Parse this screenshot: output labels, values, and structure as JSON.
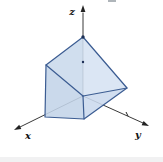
{
  "colors": {
    "background": "#ffffff",
    "axis": "#222222",
    "solid_stroke": "#3b5c92",
    "label": "#141414",
    "dot": "#1c2f55"
  },
  "axes": {
    "origin": [
      83,
      96
    ],
    "items": [
      {
        "name": "z",
        "label": "z",
        "line_end": [
          83,
          13
        ],
        "tip": [
          83,
          5
        ],
        "label_pos": [
          72,
          15
        ]
      },
      {
        "name": "x",
        "label": "x",
        "line_end": [
          20,
          127
        ],
        "tip": [
          14,
          130
        ],
        "label_pos": [
          28,
          139
        ]
      },
      {
        "name": "y",
        "label": "y",
        "line_end": [
          143,
          123
        ],
        "tip": [
          149,
          126
        ],
        "label_pos": [
          138,
          138
        ]
      }
    ]
  },
  "solid": {
    "fill_opacity": 0.88,
    "faces": [
      {
        "name": "upper-left-face",
        "points": [
          [
            83,
            37
          ],
          [
            46,
            65
          ],
          [
            83,
            96
          ]
        ],
        "fill": "#c9d9ec"
      },
      {
        "name": "upper-right-face",
        "points": [
          [
            83,
            37
          ],
          [
            83,
            96
          ],
          [
            127,
            88
          ]
        ],
        "fill": "#d6e3f2"
      },
      {
        "name": "lower-left-face",
        "points": [
          [
            46,
            65
          ],
          [
            45,
            117
          ],
          [
            84,
            119
          ],
          [
            83,
            96
          ]
        ],
        "fill": "#c3d4e8"
      },
      {
        "name": "lower-right-face",
        "points": [
          [
            83,
            96
          ],
          [
            84,
            119
          ],
          [
            127,
            88
          ]
        ],
        "fill": "#cbdaee"
      }
    ],
    "outline": [
      [
        83,
        37
      ],
      [
        46,
        65
      ],
      [
        45,
        117
      ],
      [
        84,
        119
      ],
      [
        127,
        88
      ]
    ],
    "inner_edges": [
      [
        [
          46,
          65
        ],
        [
          83,
          96
        ]
      ],
      [
        [
          83,
          96
        ],
        [
          84,
          119
        ]
      ],
      [
        [
          83,
          96
        ],
        [
          127,
          88
        ]
      ]
    ]
  },
  "marks": {
    "vertex_dots": [
      [
        83,
        37
      ]
    ],
    "axis_dots": [
      [
        83,
        62
      ]
    ],
    "tick_segments": [
      [
        [
          126,
          112
        ],
        [
          128,
          116
        ]
      ]
    ]
  }
}
